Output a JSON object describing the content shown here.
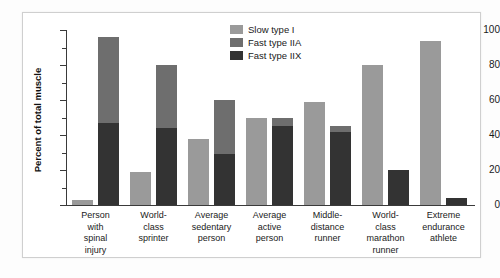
{
  "chart_data": {
    "type": "bar",
    "title": "",
    "xlabel": "",
    "ylabel": "Percent of total muscle",
    "ylim": [
      0,
      100
    ],
    "yticks": [
      0,
      20,
      40,
      60,
      80,
      100
    ],
    "yminorticks": [
      10,
      30,
      50,
      70,
      90
    ],
    "grid": false,
    "legend_position": "top-center-right",
    "categories": [
      "Person with spinal injury",
      "World-class sprinter",
      "Average sedentary person",
      "Average active person",
      "Middle-distance runner",
      "World-class marathon runner",
      "Extreme endurance athlete"
    ],
    "category_lines": [
      [
        "Person",
        "with",
        "spinal",
        "injury"
      ],
      [
        "World-",
        "class",
        "sprinter"
      ],
      [
        "Average",
        "sedentary",
        "person"
      ],
      [
        "Average",
        "active",
        "person"
      ],
      [
        "Middle-",
        "distance",
        "runner"
      ],
      [
        "World-",
        "class",
        "marathon",
        "runner"
      ],
      [
        "Extreme",
        "endurance",
        "athlete"
      ]
    ],
    "series": [
      {
        "name": "Slow type I",
        "color": "#9a9a9a",
        "values": [
          3,
          19,
          38,
          50,
          59,
          80,
          94
        ]
      },
      {
        "name": "Fast type IIA",
        "color": "#6e6e6e",
        "values": [
          49,
          36,
          31,
          5,
          3,
          0,
          0
        ]
      },
      {
        "name": "Fast type IIX",
        "color": "#333333",
        "values": [
          47,
          44,
          29,
          45,
          42,
          20,
          4
        ]
      }
    ],
    "stacked_bar_totals": [
      96,
      80,
      60,
      50,
      45,
      20,
      4
    ]
  },
  "legend": {
    "items": [
      {
        "label": "Slow type I",
        "color": "#9a9a9a"
      },
      {
        "label": "Fast type IIA",
        "color": "#6e6e6e"
      },
      {
        "label": "Fast type IIX",
        "color": "#333333"
      }
    ]
  }
}
